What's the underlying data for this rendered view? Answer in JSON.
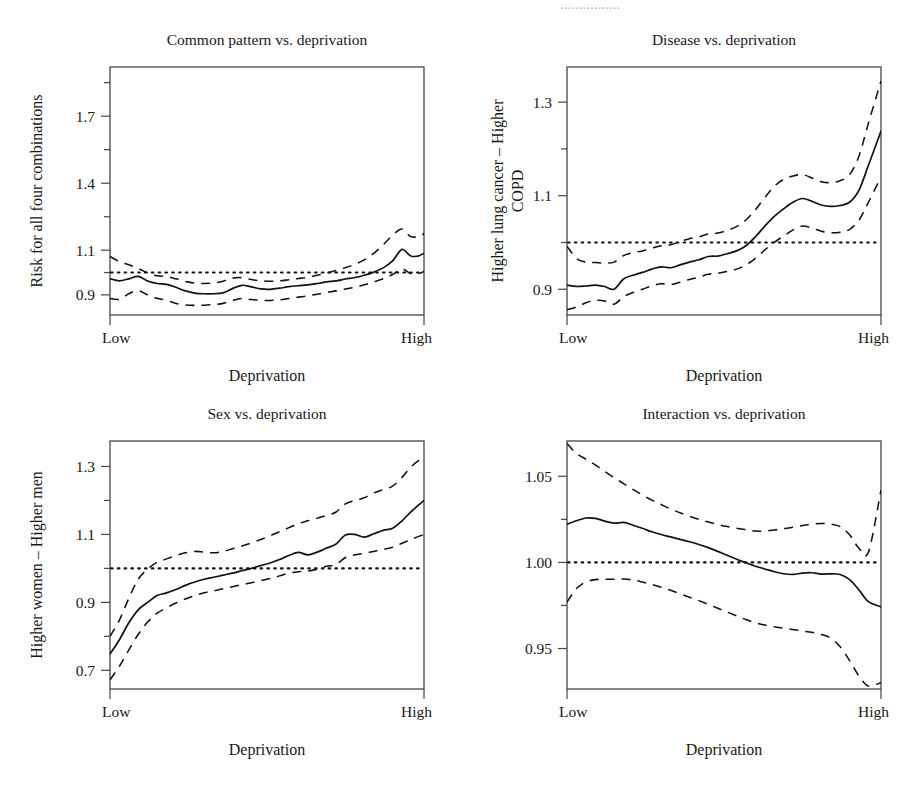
{
  "figure": {
    "partial_header_text": "................",
    "background": "#ffffff",
    "ink_color": "#111111",
    "frame_color": "#4c4c4c"
  },
  "chart_data": [
    {
      "id": "common-pattern",
      "type": "line",
      "title": "Common pattern vs. deprivation",
      "ylabel": "Risk for all four combinations",
      "xlabel": "Deprivation",
      "xticklabels": [
        "Low",
        "High"
      ],
      "yticks": [
        0.9,
        1.1,
        1.4,
        1.7
      ],
      "yticklabels": [
        "0.9",
        "1.1",
        "1.4",
        "1.7"
      ],
      "yminor": [
        1.0,
        1.25,
        1.55,
        1.85
      ],
      "ylim": [
        0.81,
        1.92
      ],
      "xlim": [
        0,
        100
      ],
      "grid": false,
      "legend": "none",
      "reference_line": 1.0,
      "x": [
        0,
        3,
        6,
        9,
        12,
        15,
        18,
        21,
        24,
        27,
        30,
        33,
        36,
        39,
        42,
        45,
        48,
        51,
        54,
        57,
        60,
        63,
        66,
        69,
        72,
        75,
        78,
        81,
        84,
        87,
        90,
        93,
        96,
        100
      ],
      "series": [
        {
          "name": "estimate",
          "style": "solid",
          "values": [
            0.972,
            0.963,
            0.972,
            0.983,
            0.962,
            0.951,
            0.947,
            0.934,
            0.918,
            0.908,
            0.905,
            0.905,
            0.909,
            0.928,
            0.943,
            0.936,
            0.927,
            0.925,
            0.93,
            0.937,
            0.941,
            0.945,
            0.951,
            0.958,
            0.963,
            0.971,
            0.978,
            0.988,
            1.002,
            1.021,
            1.052,
            1.104,
            1.073,
            1.086
          ]
        },
        {
          "name": "upper-ci",
          "style": "dashed",
          "values": [
            1.072,
            1.049,
            1.035,
            1.018,
            0.999,
            0.986,
            0.982,
            0.972,
            0.96,
            0.953,
            0.951,
            0.953,
            0.961,
            0.975,
            0.977,
            0.969,
            0.963,
            0.961,
            0.963,
            0.968,
            0.973,
            0.979,
            0.988,
            0.998,
            1.009,
            1.022,
            1.037,
            1.057,
            1.086,
            1.124,
            1.167,
            1.195,
            1.16,
            1.174
          ]
        },
        {
          "name": "lower-ci",
          "style": "dashed",
          "values": [
            0.884,
            0.88,
            0.905,
            0.919,
            0.9,
            0.885,
            0.876,
            0.862,
            0.855,
            0.853,
            0.854,
            0.857,
            0.862,
            0.875,
            0.884,
            0.879,
            0.876,
            0.875,
            0.878,
            0.884,
            0.89,
            0.896,
            0.903,
            0.911,
            0.918,
            0.926,
            0.934,
            0.945,
            0.958,
            0.972,
            0.991,
            1.016,
            0.995,
            1.005
          ]
        }
      ],
      "tail": {
        "x": [
          100,
          104,
          108,
          112,
          116,
          120
        ],
        "estimate": [
          1.086,
          1.148,
          1.245,
          1.385,
          1.525,
          1.645
        ],
        "upper": [
          1.174,
          1.255,
          1.38,
          1.545,
          1.7,
          1.81
        ],
        "lower": [
          1.005,
          1.058,
          1.135,
          1.248,
          1.375,
          1.47
        ]
      }
    },
    {
      "id": "disease",
      "type": "line",
      "title": "Disease vs. deprivation",
      "ylabel": "Higher lung cancer – Higher COPD",
      "ylabel_lines": [
        "Higher lung cancer – Higher",
        "COPD"
      ],
      "xlabel": "Deprivation",
      "xticklabels": [
        "Low",
        "High"
      ],
      "yticks": [
        0.9,
        1.1,
        1.3
      ],
      "yticklabels": [
        "0.9",
        "1.1",
        "1.3"
      ],
      "yminor": [
        1.0,
        1.2,
        1.4
      ],
      "ylim": [
        0.845,
        1.375
      ],
      "xlim": [
        0,
        100
      ],
      "grid": false,
      "legend": "none",
      "reference_line": 1.0,
      "x": [
        0,
        3,
        6,
        9,
        12,
        15,
        18,
        21,
        24,
        27,
        30,
        33,
        36,
        39,
        42,
        45,
        48,
        51,
        54,
        57,
        60,
        63,
        66,
        69,
        72,
        75,
        78,
        81,
        84,
        87,
        90,
        93,
        96,
        100
      ],
      "series": [
        {
          "name": "estimate",
          "style": "solid",
          "values": [
            0.909,
            0.906,
            0.907,
            0.909,
            0.906,
            0.9,
            0.922,
            0.93,
            0.936,
            0.943,
            0.948,
            0.946,
            0.952,
            0.958,
            0.963,
            0.97,
            0.971,
            0.976,
            0.982,
            0.993,
            1.012,
            1.035,
            1.056,
            1.072,
            1.086,
            1.094,
            1.088,
            1.08,
            1.077,
            1.079,
            1.086,
            1.112,
            1.165,
            1.238
          ]
        },
        {
          "name": "upper-ci",
          "style": "dashed",
          "values": [
            0.992,
            0.966,
            0.958,
            0.957,
            0.956,
            0.958,
            0.972,
            0.978,
            0.982,
            0.988,
            0.993,
            0.995,
            1.002,
            1.008,
            1.012,
            1.018,
            1.02,
            1.026,
            1.034,
            1.048,
            1.07,
            1.096,
            1.12,
            1.135,
            1.142,
            1.145,
            1.138,
            1.13,
            1.128,
            1.132,
            1.145,
            1.185,
            1.255,
            1.345
          ]
        },
        {
          "name": "lower-ci",
          "style": "dashed",
          "values": [
            0.856,
            0.862,
            0.871,
            0.876,
            0.875,
            0.868,
            0.884,
            0.893,
            0.9,
            0.907,
            0.912,
            0.91,
            0.915,
            0.921,
            0.926,
            0.932,
            0.934,
            0.938,
            0.943,
            0.952,
            0.966,
            0.984,
            1.0,
            1.014,
            1.027,
            1.035,
            1.031,
            1.024,
            1.021,
            1.022,
            1.028,
            1.048,
            1.086,
            1.14
          ]
        }
      ]
    },
    {
      "id": "sex",
      "type": "line",
      "title": "Sex vs. deprivation",
      "ylabel": "Higher women – Higher men",
      "xlabel": "Deprivation",
      "xticklabels": [
        "Low",
        "High"
      ],
      "yticks": [
        0.7,
        0.9,
        1.1,
        1.3
      ],
      "yticklabels": [
        "0.7",
        "0.9",
        "1.1",
        "1.3"
      ],
      "yminor": [
        0.8,
        1.0,
        1.2,
        1.4
      ],
      "ylim": [
        0.645,
        1.375
      ],
      "xlim": [
        0,
        100
      ],
      "grid": false,
      "legend": "none",
      "reference_line": 1.0,
      "x": [
        0,
        3,
        6,
        9,
        12,
        15,
        18,
        21,
        24,
        27,
        30,
        33,
        36,
        39,
        42,
        45,
        48,
        51,
        54,
        57,
        60,
        63,
        66,
        69,
        72,
        75,
        78,
        81,
        84,
        87,
        90,
        93,
        96,
        100
      ],
      "series": [
        {
          "name": "estimate",
          "style": "solid",
          "values": [
            0.748,
            0.79,
            0.84,
            0.878,
            0.9,
            0.92,
            0.928,
            0.938,
            0.95,
            0.96,
            0.968,
            0.974,
            0.98,
            0.986,
            0.993,
            1.0,
            1.008,
            1.016,
            1.026,
            1.038,
            1.047,
            1.04,
            1.048,
            1.06,
            1.072,
            1.098,
            1.1,
            1.092,
            1.102,
            1.112,
            1.118,
            1.14,
            1.168,
            1.2
          ]
        },
        {
          "name": "upper-ci",
          "style": "dashed",
          "values": [
            0.8,
            0.848,
            0.912,
            0.968,
            0.998,
            1.018,
            1.028,
            1.038,
            1.046,
            1.05,
            1.048,
            1.046,
            1.05,
            1.058,
            1.066,
            1.075,
            1.085,
            1.096,
            1.108,
            1.12,
            1.132,
            1.14,
            1.148,
            1.156,
            1.166,
            1.19,
            1.2,
            1.208,
            1.222,
            1.232,
            1.242,
            1.268,
            1.3,
            1.33
          ]
        },
        {
          "name": "lower-ci",
          "style": "dashed",
          "values": [
            0.672,
            0.712,
            0.76,
            0.806,
            0.842,
            0.868,
            0.884,
            0.898,
            0.91,
            0.92,
            0.928,
            0.934,
            0.94,
            0.946,
            0.952,
            0.958,
            0.964,
            0.97,
            0.978,
            0.986,
            0.99,
            0.992,
            0.998,
            1.006,
            1.012,
            1.032,
            1.04,
            1.044,
            1.05,
            1.056,
            1.062,
            1.074,
            1.086,
            1.1
          ]
        }
      ]
    },
    {
      "id": "interaction",
      "type": "line",
      "title": "Interaction vs. deprivation",
      "ylabel": "",
      "xlabel": "Deprivation",
      "xticklabels": [
        "Low",
        "High"
      ],
      "yticks": [
        0.95,
        1.0,
        1.05
      ],
      "yticklabels": [
        "0.95",
        "1.00",
        "1.05"
      ],
      "yminor": [
        0.925,
        0.975,
        1.025,
        1.075
      ],
      "ylim": [
        0.9265,
        1.0705
      ],
      "xlim": [
        0,
        100
      ],
      "grid": false,
      "legend": "none",
      "reference_line": 1.0,
      "x": [
        0,
        3,
        6,
        9,
        12,
        15,
        18,
        21,
        24,
        27,
        30,
        33,
        36,
        39,
        42,
        45,
        48,
        51,
        54,
        57,
        60,
        63,
        66,
        69,
        72,
        75,
        78,
        81,
        84,
        87,
        90,
        93,
        96,
        100
      ],
      "series": [
        {
          "name": "estimate",
          "style": "solid",
          "values": [
            1.0222,
            1.0242,
            1.0258,
            1.0256,
            1.024,
            1.0228,
            1.0232,
            1.0216,
            1.0198,
            1.0178,
            1.0162,
            1.0148,
            1.0134,
            1.012,
            1.0104,
            1.0086,
            1.0064,
            1.0042,
            1.0018,
            0.9998,
            0.9978,
            0.9962,
            0.9946,
            0.9934,
            0.993,
            0.9938,
            0.994,
            0.9932,
            0.9934,
            0.993,
            0.99,
            0.984,
            0.9772,
            0.9742
          ]
        },
        {
          "name": "upper-ci",
          "style": "dashed",
          "values": [
            1.069,
            1.0632,
            1.06,
            1.0566,
            1.0528,
            1.0492,
            1.0458,
            1.0424,
            1.0392,
            1.0362,
            1.0336,
            1.031,
            1.0288,
            1.0268,
            1.025,
            1.0234,
            1.022,
            1.0208,
            1.0198,
            1.019,
            1.0182,
            1.0182,
            1.0188,
            1.0196,
            1.0204,
            1.0214,
            1.0222,
            1.0226,
            1.0222,
            1.0208,
            1.016,
            1.0082,
            1.006,
            1.042
          ]
        },
        {
          "name": "lower-ci",
          "style": "dashed",
          "values": [
            0.977,
            0.9848,
            0.9886,
            0.99,
            0.9902,
            0.9902,
            0.9904,
            0.9898,
            0.9886,
            0.9872,
            0.9856,
            0.9838,
            0.9818,
            0.9798,
            0.9778,
            0.9756,
            0.9734,
            0.9712,
            0.969,
            0.9668,
            0.965,
            0.9636,
            0.9626,
            0.9618,
            0.961,
            0.9602,
            0.9594,
            0.9582,
            0.956,
            0.951,
            0.943,
            0.934,
            0.9282,
            0.9302
          ]
        }
      ]
    }
  ]
}
